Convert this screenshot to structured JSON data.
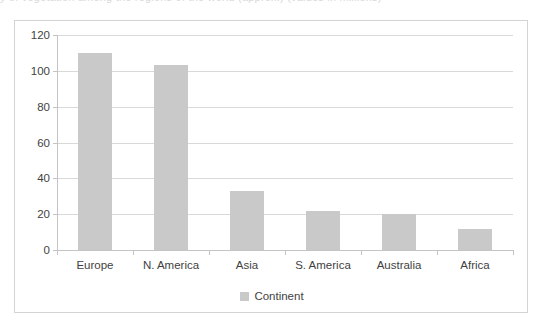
{
  "caption_sliver": "y of vegetation among the regions of the world (approx.) (values in millions)",
  "chart_data": {
    "type": "bar",
    "title": "",
    "subtitle": "",
    "xlabel": "",
    "ylabel": "",
    "categories": [
      "Europe",
      "N. America",
      "Asia",
      "S. America",
      "Australia",
      "Africa"
    ],
    "values": [
      110,
      103,
      33,
      22,
      20,
      12
    ],
    "series": [
      {
        "name": "Continent",
        "values": [
          110,
          103,
          33,
          22,
          20,
          12
        ],
        "color": "#C9C9C9"
      }
    ],
    "ylim": [
      0,
      120
    ],
    "ytick_values": [
      120,
      100,
      80,
      60,
      40,
      20,
      0
    ],
    "ytick_labels": [
      "120",
      "100",
      "80",
      "60",
      "40",
      "20",
      "0"
    ],
    "ytick_interval": 20,
    "grid": true,
    "grid_axis": "y",
    "legend": {
      "position": "bottom-center",
      "entries": [
        {
          "label": "Continent",
          "color": "#C9C9C9",
          "marker": "square"
        }
      ]
    },
    "colors": {
      "bar_fill": "#C9C9C9",
      "gridline": "#D9D9D9",
      "axis_line": "#C4C4C4",
      "chart_border": "#D4D4D4",
      "text": "#3F3F3F",
      "background": "#FFFFFF"
    }
  }
}
